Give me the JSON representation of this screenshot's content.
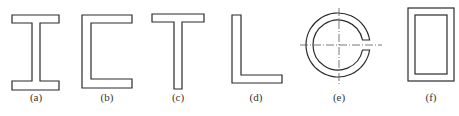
{
  "figure": {
    "stroke_color": "#2a2a2a",
    "panels": [
      {
        "id": "a",
        "label": "(a)",
        "shape": "I-section"
      },
      {
        "id": "b",
        "label": "(b)",
        "shape": "channel-section"
      },
      {
        "id": "c",
        "label": "(c)",
        "shape": "T-section"
      },
      {
        "id": "d",
        "label": "(d)",
        "shape": "angle-section"
      },
      {
        "id": "e",
        "label": "(e)",
        "shape": "open-ring-section"
      },
      {
        "id": "f",
        "label": "(f)",
        "shape": "rectangular-hollow-section"
      }
    ]
  }
}
